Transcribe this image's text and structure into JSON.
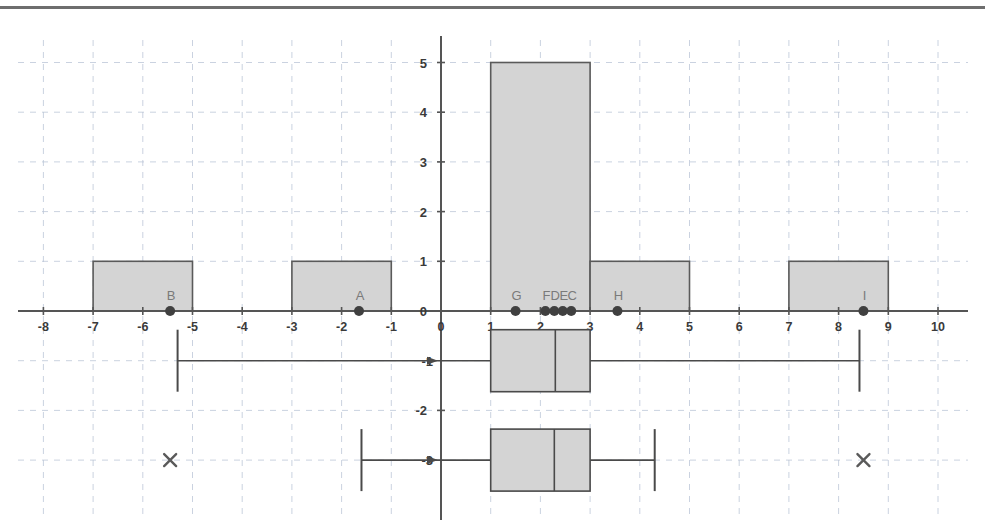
{
  "figure": {
    "title": "",
    "background": "#ffffff",
    "top_rule_color": "#6e6e6e"
  },
  "axes": {
    "x_ticks": [
      -8,
      -7,
      -6,
      -5,
      -4,
      -3,
      -2,
      -1,
      0,
      1,
      2,
      3,
      4,
      5,
      6,
      7,
      8,
      9,
      10
    ],
    "x_tick_labels": [
      "-8",
      "-7",
      "-6",
      "-5",
      "-4",
      "-3",
      "-2",
      "-1",
      "0",
      "1",
      "2",
      "3",
      "4",
      "5",
      "6",
      "7",
      "8",
      "9",
      "10"
    ],
    "y_ticks": [
      0,
      1,
      2,
      3,
      4,
      5
    ],
    "y_tick_labels": [
      "0",
      "1",
      "2",
      "3",
      "4",
      "5"
    ],
    "y_lower_ticks": [
      -2
    ],
    "y_lower_tick_labels": [
      "-2"
    ],
    "y_origin_label": "0",
    "xlim": [
      -8.85,
      11.0
    ],
    "ylim": [
      -4.35,
      5.45
    ],
    "grid": true,
    "grid_color": "#b9c4d6",
    "axis_color": "#555555",
    "grid_style": "dashed"
  },
  "chart_data": {
    "type": "bar",
    "xlabel": "",
    "ylabel": "",
    "xlim": [
      -8.85,
      11.0
    ],
    "ylim": [
      -4.35,
      5.45
    ],
    "grid": true,
    "legend": "none",
    "bar_fill": "#d4d4d4",
    "bar_stroke": "#5a5a5a",
    "bin_width": 2,
    "categories": [
      "[-7,-5)",
      "[-3,-1)",
      "[1,3)",
      "[3,5)",
      "[7,9)"
    ],
    "values": [
      1,
      1,
      5,
      1,
      1
    ],
    "bars": [
      {
        "x0": -7,
        "x1": -5,
        "height": 1
      },
      {
        "x0": -3,
        "x1": -1,
        "height": 1
      },
      {
        "x0": 1,
        "x1": 3,
        "height": 5
      },
      {
        "x0": 3,
        "x1": 5,
        "height": 1
      },
      {
        "x0": 7,
        "x1": 9,
        "height": 1
      }
    ],
    "points": [
      {
        "name": "B",
        "x": -5.45,
        "y": 0
      },
      {
        "name": "A",
        "x": -1.65,
        "y": 0
      },
      {
        "name": "G",
        "x": 1.5,
        "y": 0
      },
      {
        "name": "F",
        "x": 2.1,
        "y": 0
      },
      {
        "name": "D",
        "x": 2.28,
        "y": 0
      },
      {
        "name": "E",
        "x": 2.45,
        "y": 0
      },
      {
        "name": "C",
        "x": 2.62,
        "y": 0
      },
      {
        "name": "H",
        "x": 3.55,
        "y": 0
      },
      {
        "name": "I",
        "x": 8.5,
        "y": 0
      }
    ],
    "point_color": "#404040",
    "point_label_color": "#8a8a8a",
    "boxplots": [
      {
        "id": "boxplot-upper",
        "y": -1,
        "whisker_low": -5.3,
        "q1": 1.0,
        "median": 2.3,
        "q3": 3.0,
        "whisker_high": 8.42,
        "outliers": [],
        "fill": "#d4d4d4",
        "stroke": "#4a4a4a"
      },
      {
        "id": "boxplot-lower",
        "y": -3,
        "whisker_low": -1.6,
        "q1": 1.0,
        "median": 2.28,
        "q3": 3.0,
        "whisker_high": 4.3,
        "outliers": [
          -5.45,
          8.5
        ],
        "fill": "#d4d4d4",
        "stroke": "#4a4a4a"
      }
    ],
    "outlier_marker": "x",
    "outlier_color": "#5a5a5a"
  }
}
